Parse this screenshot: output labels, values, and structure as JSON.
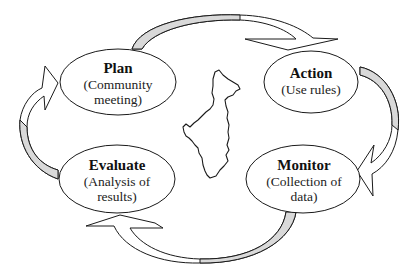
{
  "diagram": {
    "type": "cycle",
    "nodes": [
      {
        "id": "plan",
        "title": "Plan",
        "subtitle_lines": [
          "(Community",
          "meeting)"
        ]
      },
      {
        "id": "action",
        "title": "Action",
        "subtitle_lines": [
          "(Use rules)"
        ]
      },
      {
        "id": "monitor",
        "title": "Monitor",
        "subtitle_lines": [
          "(Collection of",
          "data)"
        ]
      },
      {
        "id": "evaluate",
        "title": "Evaluate",
        "subtitle_lines": [
          "(Analysis of",
          "results)"
        ]
      }
    ],
    "edges": [
      {
        "from": "plan",
        "to": "action"
      },
      {
        "from": "action",
        "to": "monitor"
      },
      {
        "from": "monitor",
        "to": "evaluate"
      },
      {
        "from": "evaluate",
        "to": "plan"
      }
    ],
    "center_image": "region-map-outline",
    "colors": {
      "stroke": "#1a1a1a",
      "arrow_shade": "#d9d9d9",
      "fill": "#ffffff"
    }
  }
}
